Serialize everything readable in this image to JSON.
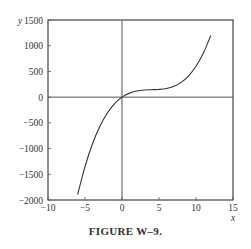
{
  "chart_data": {
    "type": "line",
    "title": "",
    "caption": "FIGURE W–9.",
    "xlabel": "x",
    "ylabel": "y",
    "xlim": [
      -10,
      15
    ],
    "ylim": [
      -2000,
      1500
    ],
    "x_ticks": [
      -10,
      -5,
      0,
      5,
      10,
      15
    ],
    "x_tick_labels": [
      "−10",
      "−5",
      "0",
      "5",
      "10",
      "15"
    ],
    "y_ticks": [
      1500,
      1000,
      500,
      0,
      -500,
      -1000,
      -1500,
      -2000
    ],
    "y_tick_labels": [
      "1500",
      "1000",
      "500",
      "0",
      "−500",
      "−1000",
      "−1500",
      "−2000"
    ],
    "grid": false,
    "zero_lines": {
      "x0": true,
      "y0": true
    },
    "series": [
      {
        "name": "y(x)",
        "x": [
          -6,
          -5,
          -4,
          -3,
          -2,
          -1,
          0,
          1,
          2,
          3,
          4,
          5,
          6,
          7,
          8,
          9,
          10,
          11,
          12
        ],
        "values": [
          -1896,
          -1350,
          -912,
          -570,
          -312,
          -126,
          0,
          78,
          120,
          138,
          144,
          150,
          168,
          210,
          288,
          414,
          600,
          858,
          1200
        ]
      }
    ],
    "line_color": "#333333"
  }
}
